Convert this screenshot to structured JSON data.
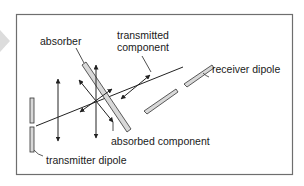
{
  "diagram": {
    "title": "",
    "labels": {
      "absorber": "absorber",
      "transmitted_line1": "transmitted",
      "transmitted_line2": "component",
      "receiver_dipole": "receiver dipole",
      "absorbed_component": "absorbed component",
      "transmitter_dipole": "transmitter dipole"
    },
    "colors": {
      "frame": "#6e6e6e",
      "line": "#222222",
      "rod_fill": "#d8d8d8",
      "side_marker": "#d9d9d9"
    }
  }
}
